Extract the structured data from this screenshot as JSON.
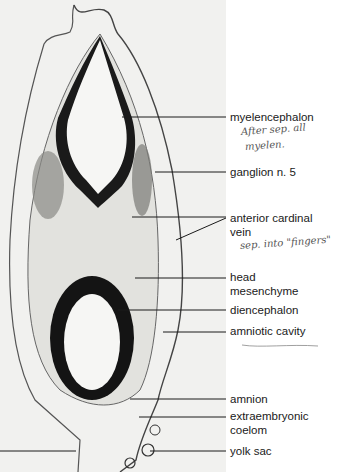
{
  "figure": {
    "type": "histology-section",
    "labels": [
      {
        "id": "myelencephalon",
        "text": "myelencephalon",
        "y": 112
      },
      {
        "id": "ganglion-n5",
        "text": "ganglion n. 5",
        "y": 167
      },
      {
        "id": "anterior-cardinal-vein-1",
        "text": "anterior cardinal",
        "y": 213
      },
      {
        "id": "anterior-cardinal-vein-2",
        "text": "vein",
        "y": 227
      },
      {
        "id": "head-mesenchyme-1",
        "text": "head",
        "y": 272
      },
      {
        "id": "head-mesenchyme-2",
        "text": "mesenchyme",
        "y": 286
      },
      {
        "id": "diencephalon",
        "text": "diencephalon",
        "y": 307
      },
      {
        "id": "amniotic-cavity",
        "text": "amniotic cavity",
        "y": 327
      },
      {
        "id": "amnion",
        "text": "amnion",
        "y": 393
      },
      {
        "id": "extraembryonic-coelom-1",
        "text": "extraembryonic",
        "y": 411
      },
      {
        "id": "extraembryonic-coelom-2",
        "text": "coelom",
        "y": 425
      },
      {
        "id": "yolk-sac",
        "text": "yolk sac",
        "y": 445
      }
    ],
    "handwritten_notes": [
      {
        "id": "note-myelen-1",
        "text": "After sep. all",
        "y": 125
      },
      {
        "id": "note-myelen-2",
        "text": "myelen.",
        "y": 139
      },
      {
        "id": "note-fingers",
        "text": "sep. into \"fingers\"",
        "y": 239
      }
    ]
  }
}
